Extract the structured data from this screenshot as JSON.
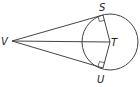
{
  "diagram": {
    "type": "geometry",
    "labels": {
      "V": "V",
      "S": "S",
      "T": "T",
      "U": "U"
    },
    "points": {
      "V": [
        12,
        41
      ],
      "S": [
        103,
        16
      ],
      "T": [
        111,
        42
      ],
      "U": [
        103,
        67
      ]
    },
    "circle": {
      "center": "T",
      "cx": 110,
      "cy": 42,
      "r": 28
    },
    "right_angles": [
      "S",
      "U"
    ],
    "stroke_color": "#444444"
  }
}
